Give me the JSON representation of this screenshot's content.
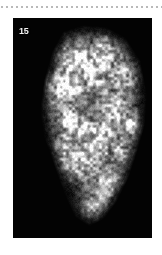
{
  "page": {
    "background_color": "#ffffff",
    "width": 162,
    "height": 255
  },
  "dotted_rule": {
    "name": "dotted-separator-line",
    "color": "#b9b9b9",
    "dot_size_px": 2,
    "dot_spacing_px": 5,
    "y_px": 6,
    "dot_count": 33
  },
  "figure_panel": {
    "background_color": "#030303",
    "label": "15",
    "label_color": "#f2f2f2",
    "x": 13,
    "y": 18,
    "width": 139,
    "height": 220
  },
  "chart_data": {
    "type": "heatmap",
    "title": "15",
    "xlabel": "",
    "ylabel": "",
    "colormap": {
      "background": "#030303",
      "low": "#1a1a1a",
      "mid": "#8f8f8f",
      "high": "#ffffff"
    },
    "xlim": [
      0,
      139
    ],
    "ylim": [
      0,
      220
    ],
    "grid": false,
    "legend": "none",
    "particle_outline": [
      [
        52,
        16
      ],
      [
        70,
        10
      ],
      [
        92,
        12
      ],
      [
        110,
        22
      ],
      [
        124,
        44
      ],
      [
        130,
        76
      ],
      [
        128,
        106
      ],
      [
        120,
        134
      ],
      [
        112,
        158
      ],
      [
        100,
        182
      ],
      [
        88,
        198
      ],
      [
        76,
        204
      ],
      [
        64,
        196
      ],
      [
        54,
        174
      ],
      [
        44,
        146
      ],
      [
        34,
        118
      ],
      [
        30,
        92
      ],
      [
        34,
        62
      ],
      [
        42,
        34
      ]
    ],
    "intensity_blobs": [
      {
        "cx": 62,
        "cy": 40,
        "r": 22,
        "i": 0.85
      },
      {
        "cx": 92,
        "cy": 36,
        "r": 20,
        "i": 0.8
      },
      {
        "cx": 112,
        "cy": 58,
        "r": 18,
        "i": 0.72
      },
      {
        "cx": 46,
        "cy": 70,
        "r": 20,
        "i": 0.78
      },
      {
        "cx": 78,
        "cy": 68,
        "r": 22,
        "i": 0.62
      },
      {
        "cx": 106,
        "cy": 92,
        "r": 20,
        "i": 0.7
      },
      {
        "cx": 56,
        "cy": 104,
        "r": 20,
        "i": 0.74
      },
      {
        "cx": 84,
        "cy": 118,
        "r": 22,
        "i": 0.8
      },
      {
        "cx": 110,
        "cy": 132,
        "r": 18,
        "i": 0.66
      },
      {
        "cx": 66,
        "cy": 146,
        "r": 20,
        "i": 0.76
      },
      {
        "cx": 94,
        "cy": 164,
        "r": 20,
        "i": 0.72
      },
      {
        "cx": 80,
        "cy": 188,
        "r": 16,
        "i": 0.6
      },
      {
        "cx": 48,
        "cy": 132,
        "r": 14,
        "i": 0.55
      },
      {
        "cx": 120,
        "cy": 108,
        "r": 12,
        "i": 0.5
      }
    ]
  }
}
